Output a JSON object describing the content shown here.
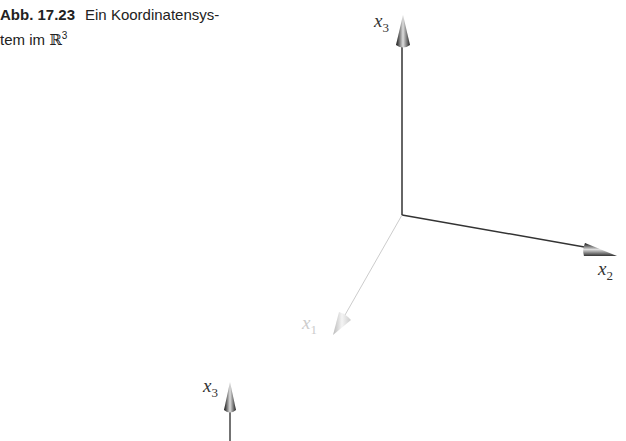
{
  "caption": {
    "label": "Abb. 17.23",
    "text_line1": "Ein Koordinatensys-",
    "text_line2": "tem im ",
    "space_symbol": "ℝ",
    "space_exp": "3"
  },
  "axes": {
    "x1": {
      "name": "x",
      "index": "1",
      "color": "#c8c8c8"
    },
    "x2": {
      "name": "x",
      "index": "2",
      "color": "#333333"
    },
    "x3": {
      "name": "x",
      "index": "3",
      "color": "#333333"
    }
  },
  "second_figure": {
    "x3": {
      "name": "x",
      "index": "3"
    }
  }
}
